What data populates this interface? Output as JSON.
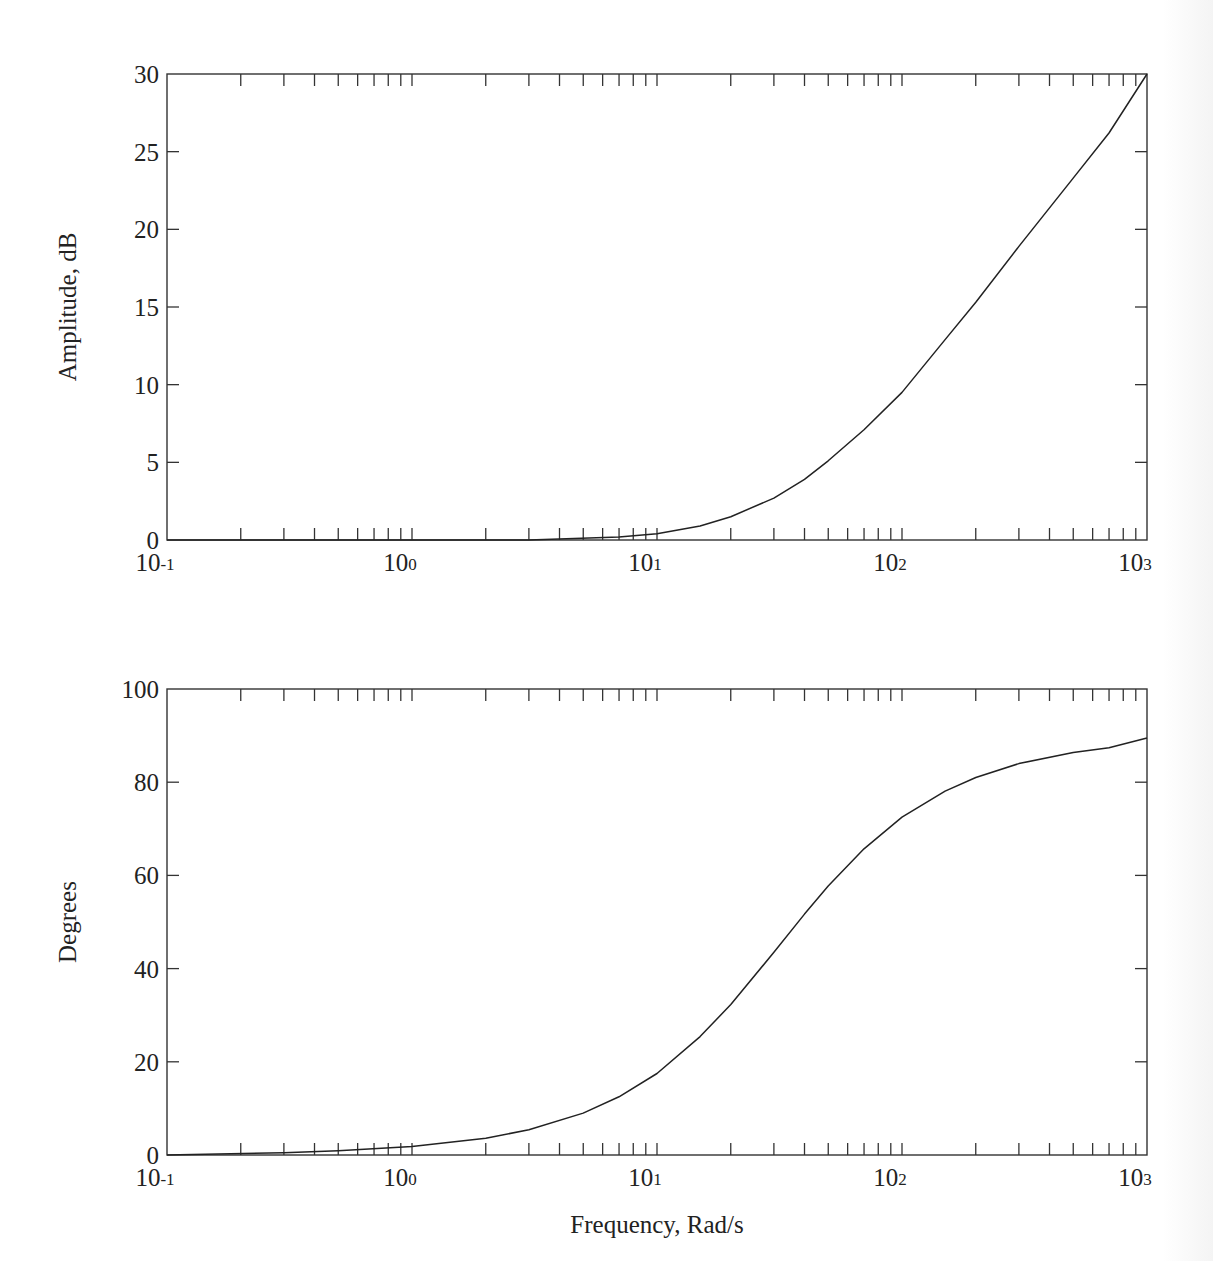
{
  "figure": {
    "x_axis_label": "Frequency, Rad/s",
    "x_ticks": [
      {
        "base": "10",
        "exp": "-1",
        "value": 0.1
      },
      {
        "base": "10",
        "exp": "0",
        "value": 1
      },
      {
        "base": "10",
        "exp": "1",
        "value": 10
      },
      {
        "base": "10",
        "exp": "2",
        "value": 100
      },
      {
        "base": "10",
        "exp": "3",
        "value": 1000
      }
    ]
  },
  "chart_data": [
    {
      "type": "line",
      "title": "",
      "xlabel": "",
      "ylabel": "Amplitude, dB",
      "xscale": "log",
      "xlim": [
        0.1,
        1000
      ],
      "ylim": [
        0,
        30
      ],
      "yticks": [
        "0",
        "5",
        "10",
        "15",
        "20",
        "25",
        "30"
      ],
      "xtick_labels": [
        "10-1",
        "100",
        "101",
        "102",
        "103"
      ],
      "grid": false,
      "legend": null,
      "series": [
        {
          "name": "Amplitude",
          "x": [
            0.1,
            1,
            3,
            7,
            10,
            15,
            20,
            30,
            40,
            50,
            70,
            100,
            150,
            200,
            300,
            500,
            700,
            1000
          ],
          "values": [
            0,
            0,
            0,
            0.2,
            0.4,
            0.9,
            1.5,
            2.7,
            3.9,
            5.1,
            7.1,
            9.5,
            12.9,
            15.3,
            18.9,
            23.3,
            26.2,
            30
          ]
        }
      ]
    },
    {
      "type": "line",
      "title": "",
      "xlabel": "Frequency, Rad/s",
      "ylabel": "Degrees",
      "xscale": "log",
      "xlim": [
        0.1,
        1000
      ],
      "ylim": [
        0,
        100
      ],
      "yticks": [
        "0",
        "20",
        "40",
        "60",
        "80",
        "100"
      ],
      "xtick_labels": [
        "10-1",
        "100",
        "101",
        "102",
        "103"
      ],
      "grid": false,
      "legend": null,
      "series": [
        {
          "name": "Phase",
          "x": [
            0.1,
            0.3,
            0.5,
            1,
            2,
            3,
            5,
            7,
            10,
            15,
            20,
            30,
            40,
            50,
            70,
            100,
            150,
            200,
            300,
            500,
            700,
            1000
          ],
          "values": [
            0,
            0.5,
            0.9,
            1.8,
            3.6,
            5.4,
            9.0,
            12.5,
            17.5,
            25.4,
            32.3,
            43.5,
            51.7,
            57.7,
            65.7,
            72.5,
            78.1,
            81.0,
            84.0,
            86.4,
            87.4,
            89.5
          ]
        }
      ]
    }
  ]
}
